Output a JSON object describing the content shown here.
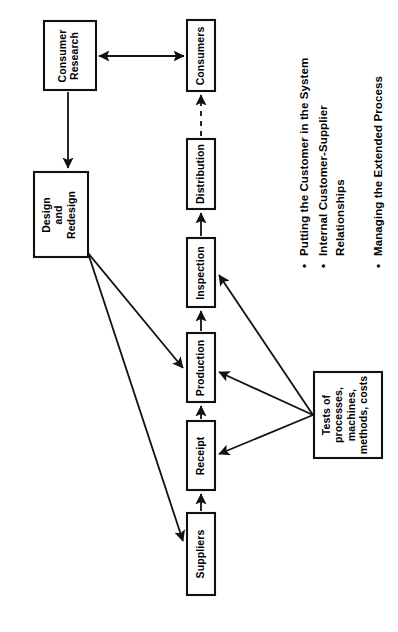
{
  "diagram": {
    "orientation": "rotated-90-ccw",
    "boxes": [
      {
        "id": "consumer-research",
        "label": "Consumer\nResearch",
        "lines": [
          "Consumer",
          "Research"
        ]
      },
      {
        "id": "consumers",
        "label": "Consumers",
        "lines": [
          "Consumers"
        ]
      },
      {
        "id": "design-and-redesign",
        "label": "Design\nand\nRedesign",
        "lines": [
          "Design",
          "and",
          "Redesign"
        ]
      },
      {
        "id": "distribution",
        "label": "Distribution",
        "lines": [
          "Distribution"
        ]
      },
      {
        "id": "inspection",
        "label": "Inspection",
        "lines": [
          "Inspection"
        ]
      },
      {
        "id": "production",
        "label": "Production",
        "lines": [
          "Production"
        ]
      },
      {
        "id": "receipt",
        "label": "Receipt",
        "lines": [
          "Receipt"
        ]
      },
      {
        "id": "suppliers",
        "label": "Suppliers",
        "lines": [
          "Suppliers"
        ]
      },
      {
        "id": "tests",
        "label": "Tests of processes, machines, methods, costs",
        "lines": [
          "Tests of",
          "processes,",
          "machines,",
          "methods, costs"
        ]
      }
    ],
    "connectors": [
      {
        "id": "consumer-research-to-consumers",
        "from": "consumer-research",
        "to": "consumers",
        "style": "solid",
        "arrows": "both"
      },
      {
        "id": "consumer-research-to-design",
        "from": "consumer-research",
        "to": "design-and-redesign",
        "style": "solid",
        "arrows": "end"
      },
      {
        "id": "distribution-to-consumers",
        "from": "distribution",
        "to": "consumers",
        "style": "dashed",
        "arrows": "end"
      },
      {
        "id": "inspection-to-distribution",
        "from": "inspection",
        "to": "distribution",
        "style": "solid",
        "arrows": "end"
      },
      {
        "id": "production-to-inspection",
        "from": "production",
        "to": "inspection",
        "style": "solid",
        "arrows": "end"
      },
      {
        "id": "receipt-to-production",
        "from": "receipt",
        "to": "production",
        "style": "solid",
        "arrows": "end"
      },
      {
        "id": "suppliers-to-receipt",
        "from": "suppliers",
        "to": "receipt",
        "style": "solid",
        "arrows": "end"
      },
      {
        "id": "design-to-production",
        "from": "design-and-redesign",
        "to": "production",
        "style": "solid",
        "arrows": "end"
      },
      {
        "id": "design-to-suppliers",
        "from": "design-and-redesign",
        "to": "suppliers",
        "style": "solid",
        "arrows": "end"
      },
      {
        "id": "tests-to-inspection",
        "from": "tests",
        "to": "inspection",
        "style": "solid",
        "arrows": "end"
      },
      {
        "id": "tests-to-production",
        "from": "tests",
        "to": "production",
        "style": "solid",
        "arrows": "end"
      },
      {
        "id": "tests-to-receipt",
        "from": "tests",
        "to": "receipt",
        "style": "solid",
        "arrows": "end"
      }
    ]
  },
  "bullets": [
    {
      "id": "bullet-1",
      "marker": "•",
      "lines": [
        "Putting the Customer in the System"
      ]
    },
    {
      "id": "bullet-2",
      "marker": "•",
      "lines": [
        "Internal Customer-Supplier",
        "Relationships"
      ]
    },
    {
      "id": "bullet-3",
      "marker": "•",
      "lines": [
        "Managing the Extended Process"
      ]
    }
  ],
  "colors": {
    "stroke": "#111111",
    "background": "#ffffff",
    "text": "#000000"
  }
}
